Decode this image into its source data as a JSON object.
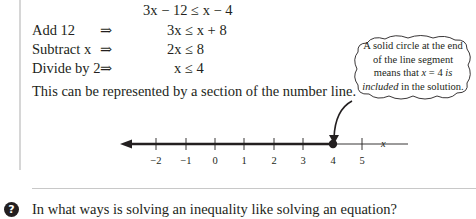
{
  "derivation": {
    "start": {
      "lhs": "3x − 12",
      "op": "≤",
      "rhs": "x − 4"
    },
    "steps": [
      {
        "label": "Add 12",
        "arrow": "⇒",
        "lhs": "3x",
        "op": "≤",
        "rhs": "x + 8"
      },
      {
        "label": "Subtract x",
        "arrow": "⇒",
        "lhs": "2x",
        "op": "≤",
        "rhs": "8"
      },
      {
        "label": "Divide by 2",
        "arrow": "⇒",
        "lhs": "x",
        "op": "≤",
        "rhs": "4"
      }
    ]
  },
  "paragraph": "This can be represented by a section of the number line.",
  "callout": {
    "line1": "A solid circle at the end",
    "line2": "of the line segment",
    "line3_pre": "means that ",
    "line3_var": "x",
    "line3_mid": " = 4 ",
    "line3_em": "is",
    "line4_em": "included",
    "line4_post": " in the solution."
  },
  "number_line": {
    "ticks": [
      "−2",
      "−1",
      "0",
      "1",
      "2",
      "3",
      "4",
      "5"
    ],
    "axis_label": "x",
    "solution_endpoint": 4,
    "endpoint_type": "solid circle",
    "shaded_direction": "left"
  },
  "question": {
    "icon": "question-icon",
    "text": "In what ways is solving an inequality like solving an equation?"
  }
}
